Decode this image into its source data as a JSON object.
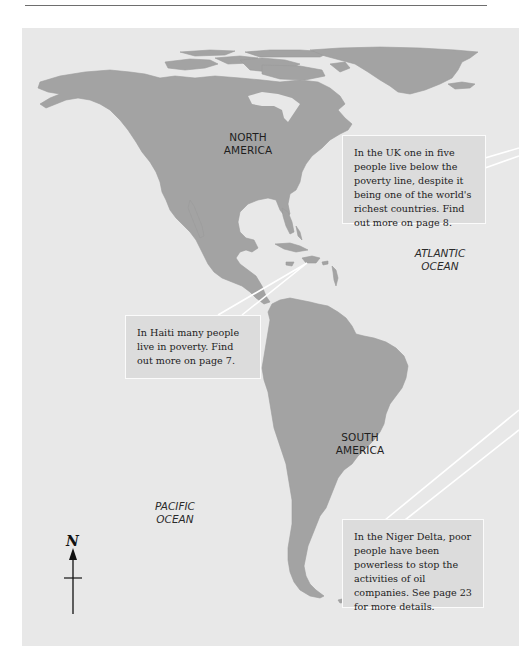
{
  "page": {
    "rule_color": "#6e6e6e"
  },
  "map": {
    "background_color": "#e8e8e8",
    "land_color": "#a3a3a3",
    "continents": [
      {
        "id": "north-america",
        "label_line1": "NORTH",
        "label_line2": "AMERICA"
      },
      {
        "id": "south-america",
        "label_line1": "SOUTH",
        "label_line2": "AMERICA"
      }
    ],
    "oceans": [
      {
        "id": "atlantic",
        "label_line1": "ATLANTIC",
        "label_line2": "OCEAN"
      },
      {
        "id": "pacific",
        "label_line1": "PACIFIC",
        "label_line2": "OCEAN"
      }
    ],
    "compass": {
      "label": "N",
      "icon": "north-arrow-icon"
    }
  },
  "callouts": {
    "uk": {
      "text": "In the UK one in five people live below the poverty line, despite it being one of the world's richest countries. Find out more on page 8."
    },
    "haiti": {
      "text": "In Haiti many people live in poverty. Find out more on page 7."
    },
    "niger": {
      "text": "In the Niger Delta, poor people have been powerless to stop the activities of oil companies. See page 23 for more details."
    }
  }
}
